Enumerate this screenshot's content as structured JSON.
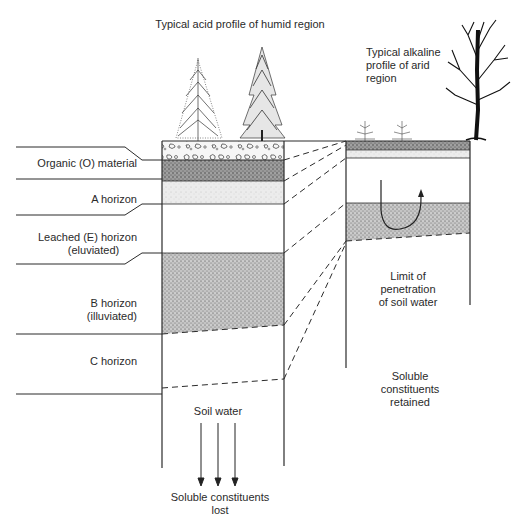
{
  "diagram": {
    "title_humid": "Typical acid profile of humid region",
    "title_arid": [
      "Typical alkaline",
      "profile of arid",
      "region"
    ],
    "horizons": [
      {
        "id": "O",
        "label": [
          "Organic (O) material"
        ]
      },
      {
        "id": "A",
        "label": [
          "A horizon"
        ]
      },
      {
        "id": "E",
        "label": [
          "Leached (E) horizon",
          "(eluviated)"
        ]
      },
      {
        "id": "B",
        "label": [
          "B horizon",
          "(illuviated)"
        ]
      },
      {
        "id": "C",
        "label": [
          "C horizon"
        ]
      }
    ],
    "arid_note": [
      "Limit of",
      "penetration",
      "of soil water"
    ],
    "retained_note": [
      "Soluble",
      "constituents",
      "retained"
    ],
    "soil_water": "Soil water",
    "lost_note": [
      "Soluble constituents",
      "lost"
    ],
    "icons": [
      "deciduous-tree-icon",
      "conifer-tree-icon",
      "shrub-icon",
      "bare-tree-icon",
      "down-arrow-icon",
      "u-turn-arrow-icon"
    ],
    "colors": {
      "line": "#2b2b2b",
      "stipple_dark": "#8a8a8a",
      "stipple_mid": "#b5b5b5",
      "stipple_light": "#e2e2e2"
    }
  }
}
